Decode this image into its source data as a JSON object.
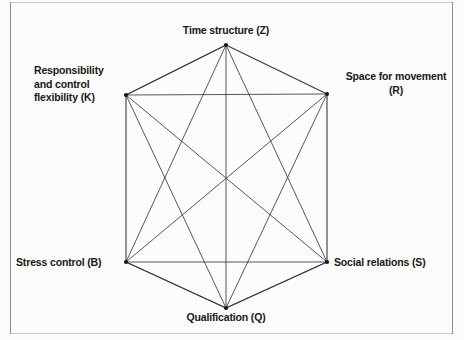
{
  "figure": {
    "type": "network-diagram",
    "background_color": "#fcfcfc",
    "line_color": "#3a3a3a",
    "text_color": "#171717",
    "frame_color": "#8d8d8d"
  },
  "nodes": [
    {
      "id": "Z",
      "name": "time-structure",
      "label": "Time structure (Z)",
      "lines": [
        "Time structure (Z)"
      ],
      "position": "top",
      "x": 226,
      "y": 45
    },
    {
      "id": "R",
      "name": "space-for-movement",
      "label": "Space for movement (R)",
      "lines": [
        "Space for movement",
        "(R)"
      ],
      "position": "upper-right",
      "x": 327,
      "y": 94
    },
    {
      "id": "K",
      "name": "responsibility-and-control-flexibility",
      "label": "Responsibility and control flexibility (K)",
      "lines": [
        "Responsibility",
        "and control",
        "flexibility (K)"
      ],
      "position": "upper-left",
      "x": 126,
      "y": 95
    },
    {
      "id": "B",
      "name": "stress-control",
      "label": "Stress control (B)",
      "lines": [
        "Stress control (B)"
      ],
      "position": "lower-left",
      "x": 126,
      "y": 262
    },
    {
      "id": "S",
      "name": "social-relations",
      "label": "Social relations (S)",
      "lines": [
        "Social relations (S)"
      ],
      "position": "lower-right",
      "x": 327,
      "y": 262
    },
    {
      "id": "Q",
      "name": "qualification",
      "label": "Qualification (Q)",
      "lines": [
        "Qualification (Q)"
      ],
      "position": "bottom",
      "x": 226,
      "y": 308
    }
  ],
  "edges": [
    {
      "from": "Z",
      "to": "R",
      "kind": "perimeter"
    },
    {
      "from": "R",
      "to": "S",
      "kind": "perimeter"
    },
    {
      "from": "S",
      "to": "Q",
      "kind": "perimeter"
    },
    {
      "from": "Q",
      "to": "B",
      "kind": "perimeter"
    },
    {
      "from": "B",
      "to": "K",
      "kind": "perimeter"
    },
    {
      "from": "K",
      "to": "Z",
      "kind": "perimeter"
    },
    {
      "from": "Z",
      "to": "K",
      "kind": "diagonal"
    },
    {
      "from": "Z",
      "to": "S",
      "kind": "diagonal"
    },
    {
      "from": "Z",
      "to": "B",
      "kind": "diagonal"
    },
    {
      "from": "Z",
      "to": "Q",
      "kind": "diagonal"
    },
    {
      "from": "R",
      "to": "K",
      "kind": "diagonal"
    },
    {
      "from": "R",
      "to": "B",
      "kind": "diagonal"
    },
    {
      "from": "R",
      "to": "Q",
      "kind": "diagonal"
    },
    {
      "from": "K",
      "to": "S",
      "kind": "diagonal"
    },
    {
      "from": "K",
      "to": "Q",
      "kind": "diagonal"
    },
    {
      "from": "B",
      "to": "S",
      "kind": "diagonal"
    },
    {
      "from": "Q",
      "to": "S",
      "kind": "diagonal"
    },
    {
      "from": "B",
      "to": "Q",
      "kind": "diagonal"
    }
  ]
}
